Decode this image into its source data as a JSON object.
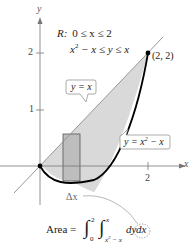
{
  "figure": {
    "type": "region-between-curves",
    "region_label": "R:",
    "region_line1": "0 ≤ x ≤ 2",
    "region_line2_left": "x",
    "region_line2_exp": "2",
    "region_line2_right": " − x ≤ y ≤ x",
    "axes": {
      "x_label": "x",
      "y_label": "y",
      "x_ticks": [
        {
          "value": 2,
          "label": "2"
        }
      ],
      "y_ticks": [
        {
          "value": 1,
          "label": "1"
        },
        {
          "value": 2,
          "label": "2"
        }
      ]
    },
    "point_label": "(2, 2)",
    "callout_upper": "y = x",
    "callout_lower_left": "y = x",
    "callout_lower_exp": "2",
    "callout_lower_right": " − x",
    "rectangle_label": "Δx",
    "formula": {
      "lhs": "Area =",
      "outer_upper": "2",
      "outer_lower": "0",
      "inner_upper": "x",
      "inner_lower_base": "x",
      "inner_lower_exp": "2",
      "inner_lower_rest": " − x",
      "dy": "dy",
      "dx": "dx"
    },
    "colors": {
      "region_fill": "#d9d9d9",
      "rect_fill": "#bdbdbd",
      "curve": "#000000",
      "line": "#8a8a8a",
      "axis": "#777777"
    }
  }
}
